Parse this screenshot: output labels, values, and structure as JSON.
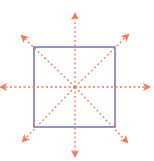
{
  "diagram": {
    "square_color": "#5b5aa8",
    "arrow_color": "#f07a5a",
    "arrow_directions": [
      "up",
      "down",
      "left",
      "right",
      "up-left",
      "up-right",
      "down-left",
      "down-right"
    ]
  }
}
